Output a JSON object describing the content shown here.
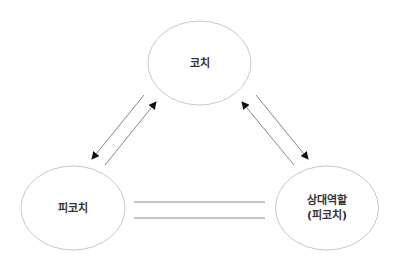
{
  "diagram": {
    "nodes": [
      {
        "id": "coach",
        "label": "코치",
        "cx": 199.5,
        "cy": 63,
        "rx": 51.5,
        "ry": 42
      },
      {
        "id": "coachee",
        "label": "피코치",
        "cx": 73,
        "cy": 208,
        "rx": 52,
        "ry": 42
      },
      {
        "id": "counterpart",
        "label_line1": "상대역할",
        "label_line2": "(피코치)",
        "cx": 327,
        "cy": 208,
        "rx": 51.5,
        "ry": 42
      }
    ],
    "edges": [
      {
        "from": "coach",
        "to": "coachee",
        "type": "arrow"
      },
      {
        "from": "coachee",
        "to": "coach",
        "type": "arrow"
      },
      {
        "from": "coach",
        "to": "counterpart",
        "type": "arrow"
      },
      {
        "from": "counterpart",
        "to": "coach",
        "type": "arrow"
      },
      {
        "from": "coachee",
        "to": "counterpart",
        "type": "double-line"
      }
    ],
    "colors": {
      "ellipse_stroke": "#c8c8c8",
      "line_stroke": "#888888",
      "arrowhead": "#111111",
      "text": "#333333"
    }
  }
}
